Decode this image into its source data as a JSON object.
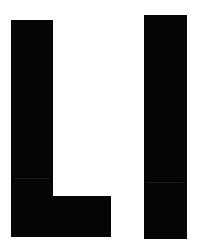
{
  "figure": {
    "text": "LI",
    "letters": [
      {
        "char": "L",
        "color": "#050505"
      },
      {
        "char": "I",
        "color": "#050505"
      }
    ],
    "background": "#ffffff"
  }
}
